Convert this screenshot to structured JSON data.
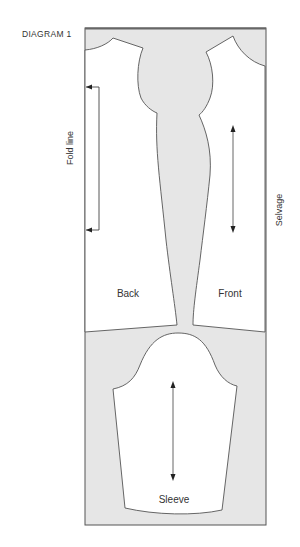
{
  "title": "DIAGRAM 1",
  "labels": {
    "fold_line": "Fold line",
    "selvage": "Selvage",
    "back": "Back",
    "front": "Front",
    "sleeve": "Sleeve"
  },
  "colors": {
    "fabric": "#e6e6e6",
    "pattern_piece": "#ffffff",
    "outline": "#555555",
    "top_edge": "#666666",
    "text": "#333333"
  }
}
